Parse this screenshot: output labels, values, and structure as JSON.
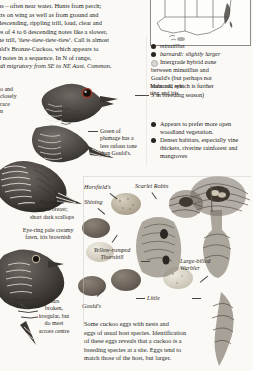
{
  "page": {
    "species_account": {
      "lines": [
        "ns – often near water. Hunts from perch;",
        "cts on wing as well as from ground and",
        "descending, rippling trill, loud, clear and",
        "es of 4 to 6 descending notes like a slower,",
        "he trill, 'tiew-tiew-tiew-tiew'.  Call is almost",
        "uld's Bronze-Cuckoo, which appears to",
        " 8 notes in a sequence. In N of range,",
        "rdi migratory from SE to NE Aust. Common."
      ]
    },
    "distribution_map": {
      "label": "distribution-map"
    },
    "legend": {
      "items": [
        {
          "marker": "solid",
          "text": "minutillus",
          "style": "italic"
        },
        {
          "marker": "solid",
          "text": "barnardi: slightly larger",
          "style": "italic-lead"
        },
        {
          "marker": "hollow",
          "text": "Intergrade hybrid zone",
          "style": "plain"
        }
      ],
      "continuation": [
        "between minutillus and",
        "Gould's (but perhaps not",
        "barnardi, which is further",
        "S in breeding season)"
      ]
    },
    "habitat": {
      "items": [
        {
          "marker": "solid",
          "text": "Appears to prefer more open woodland vegetation."
        },
        {
          "marker": "solid",
          "text": "Denser habitats, especially vine thickets, riverine rainforest and mangroves"
        }
      ]
    },
    "annotations": {
      "male_eye": [
        "Male: red eye-",
        "ring and iris"
      ],
      "green_plumage": [
        "Green of",
        "plumage has a",
        "less rufous tone",
        "than Gould's."
      ],
      "no_rufous": [
        "No rufous",
        "tint to breast;",
        "short dark scallops"
      ],
      "eye_ring": [
        "Eye-ring pale creamy",
        "fawn, iris brownish"
      ],
      "bars_broken": [
        "Bars",
        "broken,",
        "irregular, but",
        "do meet",
        "across centre"
      ],
      "left_clipped": [
        "o and",
        "closely",
        "race",
        "n"
      ]
    },
    "egg_labels": {
      "horsfields": "Horsfield's",
      "shining": "Shining",
      "scarlet_robin": "Scarlet Robin",
      "yellow_rumped_thornbill": [
        "Yellow-rumped",
        "Thornbill"
      ],
      "large_billed_warbler": [
        "Large-billed",
        "Warbler"
      ],
      "goulds": "Gould's",
      "little": "Little"
    },
    "caption": {
      "lines": [
        "Some cuckoo eggs with nests and",
        "eggs of usual host species. Identification",
        "of these eggs reveals that a cuckoo is a",
        "breeding species at a site. Eggs tend to",
        "match those of the host, but larger."
      ]
    },
    "colors": {
      "ink": "#231f1c",
      "paper": "#faf9f6",
      "rule": "#8d8b86",
      "marker_solid": "#2a2522",
      "marker_hollow": "#d9d7d2"
    }
  }
}
